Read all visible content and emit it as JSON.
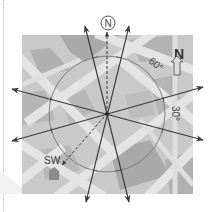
{
  "diagram": {
    "north_circle_label": "N",
    "north_arrow_label": "N",
    "angle_label_60": "60°",
    "angle_label_30": "30°",
    "sw_label": "SW"
  },
  "colors": {
    "map_bg": "#c9c9c9",
    "road": "#e6e6e6",
    "block_dark": "#a8a8a8",
    "line": "#3a3a3a",
    "circle": "#777777",
    "sw_marker": "#8a8a8a"
  }
}
